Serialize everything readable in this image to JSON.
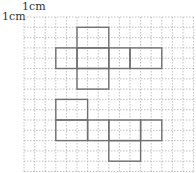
{
  "labels": {
    "top": "1cm",
    "left": "1cm"
  },
  "grid": {
    "origin_x": 24,
    "origin_y": 17,
    "cell_w": 10.6,
    "cell_h": 10.3,
    "cols": 16,
    "rows": 15,
    "line_color": "#b0b0b0",
    "dash": "1.5,1.5"
  },
  "shape_style": {
    "stroke": "#707070",
    "stroke_width": 1.4
  },
  "nets": [
    {
      "name": "net-1",
      "rects": [
        {
          "x0": 5,
          "y0": 1,
          "x1": 8,
          "y1": 3
        },
        {
          "x0": 3,
          "y0": 3,
          "x1": 5,
          "y1": 5
        },
        {
          "x0": 5,
          "y0": 3,
          "x1": 8,
          "y1": 5
        },
        {
          "x0": 8,
          "y0": 3,
          "x1": 10,
          "y1": 5
        },
        {
          "x0": 10,
          "y0": 3,
          "x1": 13,
          "y1": 5
        },
        {
          "x0": 5,
          "y0": 5,
          "x1": 8,
          "y1": 7
        }
      ]
    },
    {
      "name": "net-2",
      "rects": [
        {
          "x0": 3,
          "y0": 8,
          "x1": 6,
          "y1": 10
        },
        {
          "x0": 3,
          "y0": 10,
          "x1": 6,
          "y1": 12
        },
        {
          "x0": 6,
          "y0": 10,
          "x1": 8,
          "y1": 12
        },
        {
          "x0": 8,
          "y0": 10,
          "x1": 11,
          "y1": 12
        },
        {
          "x0": 11,
          "y0": 10,
          "x1": 13,
          "y1": 12
        },
        {
          "x0": 8,
          "y0": 12,
          "x1": 11,
          "y1": 14
        }
      ]
    }
  ]
}
